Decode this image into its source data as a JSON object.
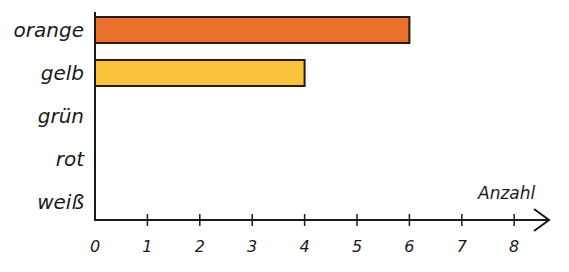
{
  "chart_data": {
    "type": "bar",
    "orientation": "horizontal",
    "title": "",
    "xlabel": "Anzahl",
    "ylabel": "",
    "categories": [
      "orange",
      "gelb",
      "grün",
      "rot",
      "weiß"
    ],
    "values": [
      6,
      4,
      0,
      0,
      0
    ],
    "colors": [
      "#e8702a",
      "#f8c23a",
      "#ffffff",
      "#ffffff",
      "#ffffff"
    ],
    "xlim": [
      0,
      8
    ],
    "xticks": [
      "0",
      "1",
      "2",
      "3",
      "4",
      "5",
      "6",
      "7",
      "8"
    ],
    "grid": false,
    "legend": null
  },
  "style": {
    "axis_color": "#1a1a1a",
    "bar_border": "#2a1a10"
  }
}
